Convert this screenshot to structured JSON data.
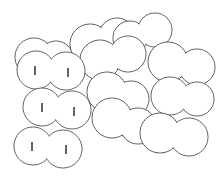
{
  "illustration": {
    "background": "#ffffff",
    "stroke": "#555555",
    "eye_color": "#222222",
    "blobs": [
      {
        "id": "top-left-back",
        "circles": [
          [
            34,
            57,
            19
          ],
          [
            56,
            58,
            17
          ]
        ],
        "eyes": []
      },
      {
        "id": "upper-mid-back",
        "circles": [
          [
            90,
            44,
            20
          ],
          [
            117,
            36,
            18
          ]
        ],
        "eyes": []
      },
      {
        "id": "top-right-back",
        "circles": [
          [
            130,
            38,
            17
          ],
          [
            155,
            30,
            17
          ]
        ],
        "eyes": []
      },
      {
        "id": "upper-mid-front",
        "circles": [
          [
            100,
            60,
            20
          ],
          [
            128,
            54,
            18
          ]
        ],
        "eyes": []
      },
      {
        "id": "right-upper",
        "circles": [
          [
            168,
            62,
            20
          ],
          [
            197,
            67,
            18
          ]
        ],
        "eyes": []
      },
      {
        "id": "mid-center",
        "circles": [
          [
            107,
            92,
            20
          ],
          [
            131,
            99,
            18
          ]
        ],
        "eyes": []
      },
      {
        "id": "mid-center-low",
        "circles": [
          [
            112,
            118,
            20
          ],
          [
            138,
            126,
            18
          ]
        ],
        "eyes": []
      },
      {
        "id": "right-mid",
        "circles": [
          [
            170,
            96,
            19
          ],
          [
            197,
            99,
            17
          ]
        ],
        "eyes": []
      },
      {
        "id": "right-lower",
        "circles": [
          [
            160,
            133,
            20
          ],
          [
            189,
            137,
            19
          ]
        ],
        "eyes": []
      },
      {
        "id": "face-1",
        "circles": [
          [
            36,
            70,
            19
          ],
          [
            66,
            71,
            19
          ]
        ],
        "eyes": [
          [
            35,
            66,
            35,
            75
          ],
          [
            68,
            68,
            68,
            77
          ]
        ]
      },
      {
        "id": "face-2",
        "circles": [
          [
            42,
            107,
            19
          ],
          [
            72,
            110,
            19
          ]
        ],
        "eyes": [
          [
            42,
            103,
            42,
            112
          ],
          [
            74,
            107,
            74,
            116
          ]
        ]
      },
      {
        "id": "face-3",
        "circles": [
          [
            33,
            146,
            19
          ],
          [
            63,
            149,
            19
          ]
        ],
        "eyes": [
          [
            32,
            142,
            32,
            151
          ],
          [
            66,
            145,
            66,
            154
          ]
        ]
      }
    ]
  }
}
